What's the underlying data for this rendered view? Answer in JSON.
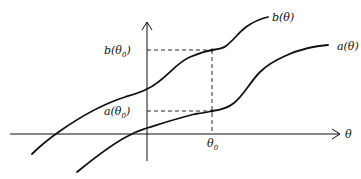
{
  "diagram": {
    "axes": {
      "x_label": "θ",
      "y_label": ""
    },
    "curves": [
      {
        "name": "b",
        "label": "b(θ)"
      },
      {
        "name": "a",
        "label": "a(θ)"
      }
    ],
    "marker": {
      "x_tick_label": "θ",
      "x_tick_sub": "0",
      "b_value_label_pre": "b(θ",
      "b_value_label_post": ")",
      "a_value_label_pre": "a(θ",
      "a_value_label_post": ")",
      "sub": "0"
    },
    "colors": {
      "ink": "#111111",
      "background": "#ffffff"
    }
  }
}
